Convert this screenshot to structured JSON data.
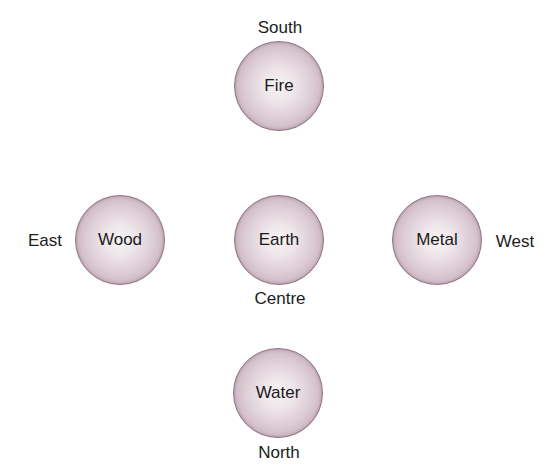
{
  "diagram": {
    "type": "five-elements-directions",
    "nodes": [
      {
        "id": "fire",
        "element": "Fire",
        "direction": "South",
        "center": [
          279,
          86
        ]
      },
      {
        "id": "wood",
        "element": "Wood",
        "direction": "East",
        "center": [
          120,
          240
        ]
      },
      {
        "id": "earth",
        "element": "Earth",
        "direction": "Centre",
        "center": [
          279,
          240
        ]
      },
      {
        "id": "metal",
        "element": "Metal",
        "direction": "West",
        "center": [
          437,
          240
        ]
      },
      {
        "id": "water",
        "element": "Water",
        "direction": "North",
        "center": [
          278,
          393
        ]
      }
    ],
    "colors": {
      "circle_center": "#f7f4f5",
      "circle_edge": "#b396a5",
      "circle_outline": "#8c7282",
      "text": "#1c1c1c",
      "background": "#ffffff"
    }
  }
}
